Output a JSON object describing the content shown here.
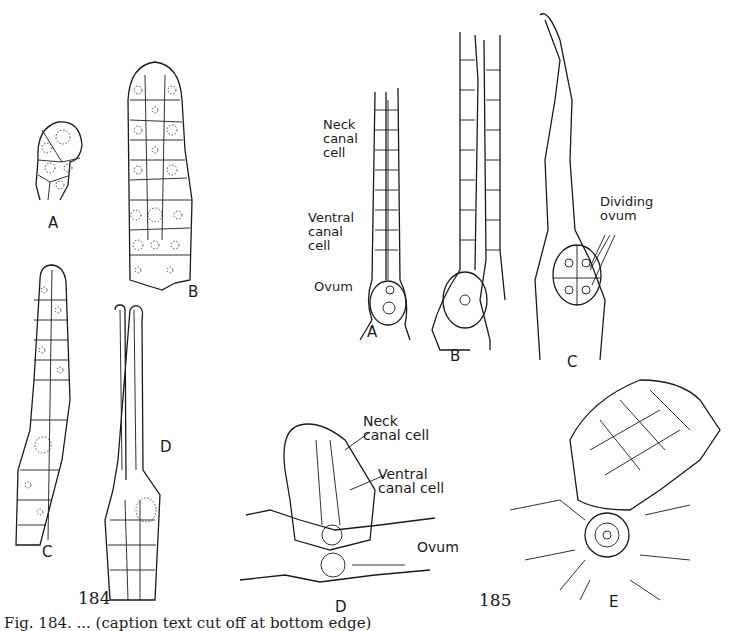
{
  "figure_184": {
    "number": "184",
    "panels": {
      "A": {
        "letter": "A"
      },
      "B": {
        "letter": "B"
      },
      "C": {
        "letter": "C"
      },
      "D": {
        "letter": "D"
      }
    }
  },
  "figure_185": {
    "number": "185",
    "panels": {
      "A": {
        "letter": "A",
        "labels": {
          "neck": "Neck\ncanal\ncell",
          "neck_l1": "Neck",
          "neck_l2": "canal",
          "neck_l3": "cell",
          "ventral_l1": "Ventral",
          "ventral_l2": "canal",
          "ventral_l3": "cell",
          "ovum": "Ovum"
        }
      },
      "B": {
        "letter": "B"
      },
      "C": {
        "letter": "C",
        "labels": {
          "dividing_l1": "Dividing",
          "dividing_l2": "ovum"
        }
      },
      "D": {
        "letter": "D",
        "labels": {
          "neck_l1": "Neck",
          "neck_l2": "canal cell",
          "ventral_l1": "Ventral",
          "ventral_l2": "canal cell",
          "ovum": "Ovum"
        }
      },
      "E": {
        "letter": "E"
      }
    }
  },
  "caption": {
    "text": "Fig. 184. ... (caption text cut off at bottom edge)"
  }
}
